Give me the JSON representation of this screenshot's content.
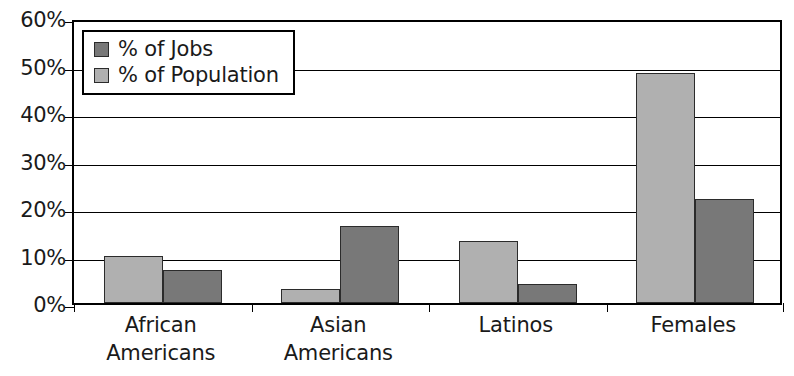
{
  "chart_data": {
    "type": "bar",
    "title": "",
    "xlabel": "",
    "ylabel": "",
    "ylim": [
      0,
      60
    ],
    "ytick_values": [
      0,
      10,
      20,
      30,
      40,
      50,
      60
    ],
    "ytick_labels": [
      "0%",
      "10%",
      "20%",
      "30%",
      "40%",
      "50%",
      "60%"
    ],
    "grid": true,
    "legend_position": "upper-left-inside",
    "categories": [
      "African Americans",
      "Asian Americans",
      "Latinos",
      "Females"
    ],
    "category_lines": [
      [
        "African",
        "Americans"
      ],
      [
        "Asian",
        "Americans"
      ],
      [
        "Latinos"
      ],
      [
        "Females"
      ]
    ],
    "series": [
      {
        "name": "% of Jobs",
        "color": "#787878",
        "values": [
          7,
          16.3,
          4,
          22
        ]
      },
      {
        "name": "% of Population",
        "color": "#b0b0b0",
        "values": [
          10,
          3,
          13,
          48.5
        ]
      }
    ],
    "bar_draw_order": [
      "% of Population",
      "% of Jobs"
    ],
    "legend_entries": [
      {
        "label": "% of Jobs",
        "swatch": "dark",
        "color": "#787878"
      },
      {
        "label": "% of Population",
        "swatch": "light",
        "color": "#b0b0b0"
      }
    ]
  },
  "colors": {
    "light_bar": "#b0b0b0",
    "dark_bar": "#787878",
    "axis": "#000000",
    "text": "#1a1a1a",
    "background": "#ffffff"
  }
}
